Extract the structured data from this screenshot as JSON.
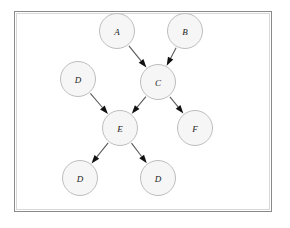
{
  "figure": {
    "frame": {
      "name": "diagram-border",
      "x": 14.5,
      "y": 11.5,
      "width": 257,
      "height": 200,
      "stroke": "#8a8a8a",
      "inner_stroke": "#c9c9c9",
      "fill": "#ffffff"
    },
    "style": {
      "node_fill": "#f6f6f6",
      "node_stroke": "#bdbdbd",
      "node_radius": 17.5,
      "edge_stroke": "#5a5a5a",
      "arrow_fill": "#111111",
      "label_color": "#1c1c1c"
    }
  },
  "chart_data": {
    "type": "diagram",
    "nodes": [
      {
        "id": "n1",
        "label": "A",
        "x": 117,
        "y": 31
      },
      {
        "id": "n2",
        "label": "B",
        "x": 185,
        "y": 31
      },
      {
        "id": "n3",
        "label": "C",
        "x": 158,
        "y": 82
      },
      {
        "id": "n4",
        "label": "D",
        "x": 78,
        "y": 79
      },
      {
        "id": "n5",
        "label": "E",
        "x": 120,
        "y": 128
      },
      {
        "id": "n6",
        "label": "F",
        "x": 195,
        "y": 128
      },
      {
        "id": "n7",
        "label": "D",
        "x": 80,
        "y": 178
      },
      {
        "id": "n8",
        "label": "D",
        "x": 158,
        "y": 178
      }
    ],
    "edges": [
      {
        "id": "e1",
        "from": "n1",
        "to": "n3",
        "label": "A-to-C",
        "directed": true
      },
      {
        "id": "e2",
        "from": "n2",
        "to": "n3",
        "label": "B-to-C",
        "directed": true
      },
      {
        "id": "e3",
        "from": "n3",
        "to": "n5",
        "label": "C-to-E",
        "directed": true
      },
      {
        "id": "e4",
        "from": "n3",
        "to": "n6",
        "label": "C-to-F",
        "directed": true
      },
      {
        "id": "e5",
        "from": "n4",
        "to": "n5",
        "label": "D-to-E",
        "directed": true
      },
      {
        "id": "e6",
        "from": "n5",
        "to": "n7",
        "label": "E-to-D-left",
        "directed": true
      },
      {
        "id": "e7",
        "from": "n5",
        "to": "n8",
        "label": "E-to-D-right",
        "directed": true
      }
    ]
  }
}
